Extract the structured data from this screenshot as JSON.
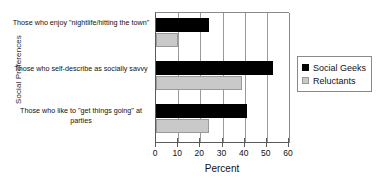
{
  "chart_data": {
    "type": "bar",
    "orientation": "horizontal",
    "title": "",
    "xlabel": "Percent",
    "ylabel": "Social Preferences",
    "xlim": [
      0,
      60
    ],
    "xticks": [
      0,
      10,
      20,
      30,
      40,
      50,
      60
    ],
    "grid": true,
    "legend_position": "right",
    "categories": [
      "Those who enjoy \"nightlife/hitting the town\"",
      "Those who self-describe as socially savvy",
      "Those who like to \"get things going\" at parties"
    ],
    "series": [
      {
        "name": "Social Geeks",
        "color": "#000000",
        "values": [
          24,
          53,
          41
        ]
      },
      {
        "name": "Reluctants",
        "color": "#c9c9c9",
        "values": [
          10,
          39,
          24
        ]
      }
    ]
  },
  "axis": {
    "y_title": "Social Preferences",
    "x_title": "Percent",
    "x_tick_labels": [
      "0",
      "10",
      "20",
      "30",
      "40",
      "50",
      "60"
    ]
  },
  "legend": {
    "entries": [
      {
        "label": "Social Geeks"
      },
      {
        "label": "Reluctants"
      }
    ]
  }
}
